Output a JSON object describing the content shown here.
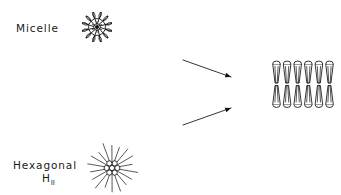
{
  "figure": {
    "background_color": "#ffffff",
    "ink_color": "#111111",
    "width": 341,
    "height": 195
  },
  "labels": {
    "micelle": "Micelle",
    "hexagonal": "Hexagonal",
    "hexagonal_phase_symbol": "H",
    "hexagonal_phase_subscript": "II"
  },
  "structures": [
    {
      "name": "micelle",
      "kind": "radial-aggregate",
      "center_x": 97,
      "center_y": 27,
      "lobe_count": 12,
      "lobe_length": 15,
      "head_radius": 4.2,
      "core_radius": 2.0,
      "description": "Surfactant molecules radiating outward, polar heads out, tails to center"
    },
    {
      "name": "hexagonal-HII",
      "kind": "inverse-hexagonal",
      "center_x": 112,
      "center_y": 168,
      "core_circle_count": 7,
      "core_circle_radius": 2.6,
      "ray_count": 18,
      "ray_length": 26,
      "description": "Inverse hexagonal phase, water core circles with lipid tails radiating out"
    },
    {
      "name": "bilayer",
      "kind": "lamellar-bilayer",
      "left_x": 272,
      "top_y": 64,
      "columns": 6,
      "rows": 2,
      "unit_width": 9,
      "unit_height": 19,
      "description": "Planar lipid bilayer, two opposed monolayers of cone-shaped lipids"
    }
  ],
  "arrows": [
    {
      "name": "arrow-micelle-to-bilayer",
      "x1": 183,
      "y1": 60,
      "x2": 231,
      "y2": 77,
      "direction": "down-right"
    },
    {
      "name": "arrow-hexagonal-to-bilayer",
      "x1": 183,
      "y1": 125,
      "x2": 231,
      "y2": 108,
      "direction": "up-right"
    }
  ]
}
